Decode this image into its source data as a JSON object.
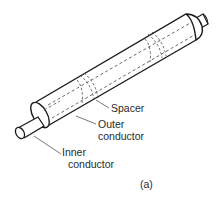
{
  "diagram": {
    "labels": {
      "spacer": "Spacer",
      "outer_conductor_line1": "Outer",
      "outer_conductor_line2": "conductor",
      "inner_conductor_line1": "Inner",
      "inner_conductor_line2": "conductor"
    },
    "caption": "(a)",
    "colors": {
      "line": "#1a1a1a",
      "leader": "#555555",
      "text": "#2a2a2a",
      "background": "#ffffff"
    }
  }
}
